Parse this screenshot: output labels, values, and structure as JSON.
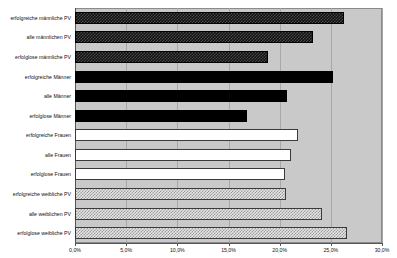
{
  "chart_data": {
    "type": "bar",
    "orientation": "horizontal",
    "title": "",
    "xlabel": "",
    "ylabel": "",
    "xlim": [
      0,
      30
    ],
    "xticks": [
      "0,0%",
      "5,0%",
      "10,0%",
      "15,0%",
      "20,0%",
      "25,0%",
      "30,0%"
    ],
    "xtick_values": [
      0,
      5,
      10,
      15,
      20,
      25,
      30
    ],
    "grid": true,
    "legend": "none",
    "plot_background": "#c9c9c9",
    "categories": [
      "erfolgreiche männliche PV",
      "alle männlichen PV",
      "erfolglose männliche PV",
      "erfolgreiche Männer",
      "alle Männer",
      "erfolglose Männer",
      "erfolgreiche Frauen",
      "alle Frauen",
      "erfolglose Frauen",
      "erfolgreiche weibliche PV",
      "alle weiblichen PV",
      "erfolglose weibliche PV"
    ],
    "values": [
      26.3,
      23.3,
      18.9,
      25.2,
      20.7,
      16.8,
      21.8,
      21.1,
      20.5,
      20.6,
      24.1,
      26.6
    ],
    "bar_styles": [
      "dark-checker",
      "dark-checker",
      "dark-checker",
      "solid-black",
      "solid-black",
      "solid-black",
      "white",
      "white",
      "white",
      "light-checker",
      "light-checker",
      "light-checker"
    ]
  }
}
